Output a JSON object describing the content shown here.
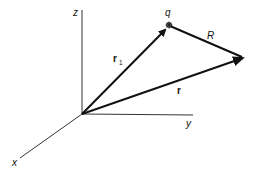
{
  "diagram": {
    "title": "",
    "axes": {
      "x_label": "x",
      "y_label": "y",
      "z_label": "z"
    },
    "vectors": {
      "r1_label": "r",
      "r1_subscript": "1",
      "r_label": "r",
      "R_label": "R"
    },
    "points": {
      "charge_label": "q"
    },
    "colors": {
      "ink": "#111111",
      "axis": "#333333",
      "background": "#ffffff"
    }
  }
}
